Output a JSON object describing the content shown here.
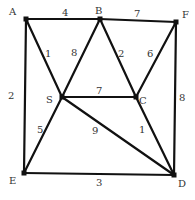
{
  "graph": {
    "nodes": [
      {
        "id": "A",
        "x": 26,
        "y": 19,
        "lx": 9,
        "ly": 15
      },
      {
        "id": "B",
        "x": 100,
        "y": 19,
        "lx": 95,
        "ly": 14
      },
      {
        "id": "F",
        "x": 176,
        "y": 22,
        "lx": 182,
        "ly": 18
      },
      {
        "id": "S",
        "x": 62,
        "y": 97,
        "lx": 46,
        "ly": 103
      },
      {
        "id": "C",
        "x": 136,
        "y": 97,
        "lx": 139,
        "ly": 104
      },
      {
        "id": "E",
        "x": 24,
        "y": 173,
        "lx": 9,
        "ly": 184
      },
      {
        "id": "D",
        "x": 174,
        "y": 175,
        "lx": 178,
        "ly": 187
      }
    ],
    "edges": [
      {
        "from": "A",
        "to": "B",
        "weight": "4",
        "lx": 62,
        "ly": 16
      },
      {
        "from": "B",
        "to": "F",
        "weight": "7",
        "lx": 134,
        "ly": 17
      },
      {
        "from": "A",
        "to": "E",
        "weight": "2",
        "lx": 8,
        "ly": 99
      },
      {
        "from": "A",
        "to": "S",
        "weight": "1",
        "lx": 45,
        "ly": 57
      },
      {
        "from": "B",
        "to": "S",
        "weight": "8",
        "lx": 71,
        "ly": 56
      },
      {
        "from": "B",
        "to": "C",
        "weight": "2",
        "lx": 118,
        "ly": 57
      },
      {
        "from": "F",
        "to": "C",
        "weight": "6",
        "lx": 147,
        "ly": 57
      },
      {
        "from": "F",
        "to": "D",
        "weight": "8",
        "lx": 179,
        "ly": 101
      },
      {
        "from": "S",
        "to": "C",
        "weight": "7",
        "lx": 96,
        "ly": 94
      },
      {
        "from": "S",
        "to": "E",
        "weight": "5",
        "lx": 37,
        "ly": 133
      },
      {
        "from": "S",
        "to": "D",
        "weight": "9",
        "lx": 92,
        "ly": 134
      },
      {
        "from": "C",
        "to": "D",
        "weight": "1",
        "lx": 139,
        "ly": 133
      },
      {
        "from": "E",
        "to": "D",
        "weight": "3",
        "lx": 96,
        "ly": 186
      }
    ]
  }
}
